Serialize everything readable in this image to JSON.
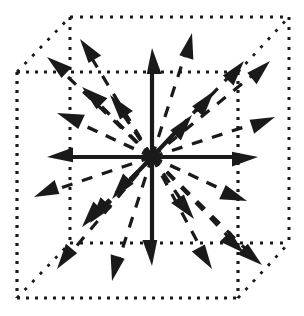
{
  "figure": {
    "title": "26-neighborhood cube direction diagram",
    "width": 304,
    "height": 316,
    "background_color": "#ffffff",
    "ink_color": "#1a1a1a"
  },
  "cube": {
    "description": "Dotted wireframe cube drawn in oblique projection",
    "line_style": "dotted",
    "stroke_color": "#1a1a1a",
    "front_face_stroke_width": 3.2,
    "back_face_stroke_width": 3.0,
    "connector_stroke_width": 2.8,
    "front_face": {
      "left": 17,
      "top": 72,
      "right": 238,
      "bottom": 298
    },
    "back_face": {
      "left": 70,
      "top": 17,
      "right": 289,
      "bottom": 243
    },
    "depth_offset": {
      "dx": 52,
      "dy": -55
    },
    "front_dash_pattern": "3 6",
    "back_dash_pattern": "3 7",
    "connector_dash_pattern": "3 8"
  },
  "center": {
    "label": "origin",
    "x": 152,
    "y": 157
  },
  "styles": {
    "solid_axis": {
      "line_style": "solid",
      "stroke_width": 4.2,
      "head_length": 26,
      "head_half_width": 9.5
    },
    "dashed_mid": {
      "line_style": "dashed",
      "stroke_width": 3.4,
      "dash_pattern": "11 9",
      "head_length": 26,
      "head_half_width": 10
    },
    "dashed_corner": {
      "line_style": "dashed",
      "stroke_width": 3.2,
      "dash_pattern": "11 10",
      "head_length": 25,
      "head_half_width": 9.5
    }
  },
  "arrows": {
    "count_total": 26,
    "count_solid_axes": 6,
    "count_dashed": 20,
    "solid_axes": [
      {
        "name": "axis-plus-y-up",
        "dx": 0,
        "dy": -109,
        "style": "solid_axis"
      },
      {
        "name": "axis-minus-y-down",
        "dx": 0,
        "dy": 109,
        "style": "solid_axis"
      },
      {
        "name": "axis-minus-x-left",
        "dx": -105,
        "dy": 0,
        "style": "solid_axis"
      },
      {
        "name": "axis-plus-x-right",
        "dx": 106,
        "dy": 0,
        "style": "solid_axis"
      },
      {
        "name": "axis-plus-z-back",
        "dx": 40,
        "dy": -42,
        "style": "solid_axis"
      },
      {
        "name": "axis-minus-z-front",
        "dx": -40,
        "dy": 42,
        "style": "solid_axis"
      }
    ],
    "dashed_edges": [
      {
        "name": "edge-up-left-front",
        "dx": -70,
        "dy": -70,
        "style": "dashed_mid"
      },
      {
        "name": "edge-up-right-back",
        "dx": 92,
        "dy": -96,
        "style": "dashed_corner"
      },
      {
        "name": "edge-down-left-front",
        "dx": -70,
        "dy": 70,
        "style": "dashed_mid"
      },
      {
        "name": "edge-down-right-back",
        "dx": 92,
        "dy": 96,
        "style": "dashed_corner"
      },
      {
        "name": "edge-left-back",
        "dx": -95,
        "dy": -44,
        "style": "dashed_mid"
      },
      {
        "name": "edge-right-back",
        "dx": 123,
        "dy": -40,
        "style": "dashed_corner"
      },
      {
        "name": "edge-left-front",
        "dx": -118,
        "dy": 40,
        "style": "dashed_corner"
      },
      {
        "name": "edge-right-front",
        "dx": 95,
        "dy": 44,
        "style": "dashed_mid"
      },
      {
        "name": "edge-up-back",
        "dx": 40,
        "dy": -124,
        "style": "dashed_corner"
      },
      {
        "name": "edge-down-front",
        "dx": -40,
        "dy": 124,
        "style": "dashed_corner"
      },
      {
        "name": "edge-up-front",
        "dx": -42,
        "dy": -62,
        "style": "dashed_mid"
      },
      {
        "name": "edge-down-back",
        "dx": 42,
        "dy": 62,
        "style": "dashed_mid"
      }
    ],
    "dashed_corners": [
      {
        "name": "corner-up-left-back",
        "dx": -105,
        "dy": -100,
        "style": "dashed_corner"
      },
      {
        "name": "corner-up-right-front",
        "dx": 62,
        "dy": -66,
        "style": "dashed_mid"
      },
      {
        "name": "corner-down-left-back",
        "dx": -62,
        "dy": 66,
        "style": "dashed_mid"
      },
      {
        "name": "corner-down-right-front",
        "dx": 60,
        "dy": 112,
        "style": "dashed_corner"
      },
      {
        "name": "corner-down-left-front",
        "dx": -95,
        "dy": 112,
        "style": "dashed_corner"
      },
      {
        "name": "corner-up-right-back-2",
        "dx": 118,
        "dy": -96,
        "style": "dashed_corner"
      },
      {
        "name": "corner-down-right-back-2",
        "dx": 110,
        "dy": 108,
        "style": "dashed_corner"
      },
      {
        "name": "corner-up-left-back-2",
        "dx": -72,
        "dy": -118,
        "style": "dashed_corner"
      }
    ]
  }
}
